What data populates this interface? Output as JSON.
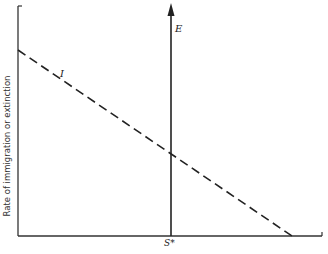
{
  "diagram": {
    "type": "island-biogeography-equilibrium",
    "y_axis_label": "Rate of immigration or extinction",
    "x_axis_label_cut_off": true,
    "curves": [
      {
        "id": "immigration",
        "label": "I",
        "style": "dashed",
        "description": "decreasing straight line"
      },
      {
        "id": "extinction",
        "label": "E",
        "style": "solid vertical arrow",
        "description": "vertical line at S*"
      }
    ],
    "equilibrium_label": "S*",
    "colors": {
      "line": "#222222",
      "background": "#ffffff"
    }
  },
  "labels": {
    "e": "E",
    "i": "I",
    "s_star": "S*",
    "y_axis": "Rate of immigration or extinction"
  }
}
